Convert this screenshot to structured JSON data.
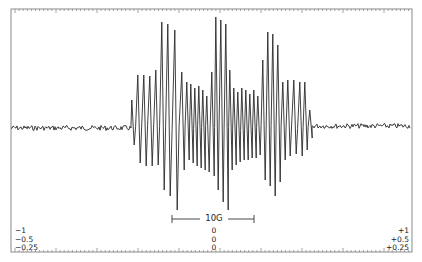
{
  "chart_data": {
    "type": "line",
    "title": "",
    "xlabel": "Magnetic field",
    "ylabel": "First-derivative absorption (dI/dH)",
    "grid": false,
    "legend": null,
    "scale_bar": {
      "label": "10G",
      "x_start_px": 172,
      "x_end_px": 254
    },
    "left_labels": [
      "−1",
      "−0.5",
      "−0.25"
    ],
    "center_labels": [
      "0",
      "0",
      "0"
    ],
    "right_labels": [
      "+1",
      "+0.5",
      "+0.25"
    ],
    "baseline_px": 128,
    "frame_px": {
      "left": 11,
      "top": 9,
      "right": 412,
      "bottom": 252
    },
    "noise_region_left_px": [
      11,
      131
    ],
    "noise_region_right_px": [
      313,
      410
    ],
    "lines": [
      {
        "x": 133,
        "top": 100,
        "bottom": 145
      },
      {
        "x": 139,
        "top": 75,
        "bottom": 163
      },
      {
        "x": 145,
        "top": 75,
        "bottom": 166
      },
      {
        "x": 151,
        "top": 76,
        "bottom": 166
      },
      {
        "x": 157,
        "top": 70,
        "bottom": 165
      },
      {
        "x": 163,
        "top": 22,
        "bottom": 190
      },
      {
        "x": 169,
        "top": 24,
        "bottom": 196
      },
      {
        "x": 176,
        "top": 30,
        "bottom": 210
      },
      {
        "x": 183,
        "top": 72,
        "bottom": 170
      },
      {
        "x": 188,
        "top": 82,
        "bottom": 160
      },
      {
        "x": 192,
        "top": 84,
        "bottom": 163
      },
      {
        "x": 196,
        "top": 88,
        "bottom": 166
      },
      {
        "x": 200,
        "top": 86,
        "bottom": 168
      },
      {
        "x": 204,
        "top": 90,
        "bottom": 170
      },
      {
        "x": 208,
        "top": 96,
        "bottom": 172
      },
      {
        "x": 213,
        "top": 72,
        "bottom": 176
      },
      {
        "x": 217,
        "top": 17,
        "bottom": 190
      },
      {
        "x": 222,
        "top": 20,
        "bottom": 202
      },
      {
        "x": 227,
        "top": 24,
        "bottom": 210
      },
      {
        "x": 231,
        "top": 70,
        "bottom": 170
      },
      {
        "x": 235,
        "top": 88,
        "bottom": 165
      },
      {
        "x": 239,
        "top": 92,
        "bottom": 162
      },
      {
        "x": 243,
        "top": 88,
        "bottom": 160
      },
      {
        "x": 247,
        "top": 90,
        "bottom": 160
      },
      {
        "x": 251,
        "top": 94,
        "bottom": 158
      },
      {
        "x": 255,
        "top": 90,
        "bottom": 158
      },
      {
        "x": 259,
        "top": 96,
        "bottom": 155
      },
      {
        "x": 264,
        "top": 60,
        "bottom": 180
      },
      {
        "x": 269,
        "top": 32,
        "bottom": 186
      },
      {
        "x": 274,
        "top": 34,
        "bottom": 196
      },
      {
        "x": 279,
        "top": 45,
        "bottom": 182
      },
      {
        "x": 284,
        "top": 82,
        "bottom": 160
      },
      {
        "x": 289,
        "top": 80,
        "bottom": 156
      },
      {
        "x": 295,
        "top": 80,
        "bottom": 154
      },
      {
        "x": 301,
        "top": 82,
        "bottom": 156
      },
      {
        "x": 306,
        "top": 82,
        "bottom": 150
      },
      {
        "x": 311,
        "top": 110,
        "bottom": 138
      }
    ]
  },
  "colors": {
    "trace": "#2a2a2a",
    "frame": "#8a8a8a",
    "text": "#222222",
    "background": "#ffffff"
  }
}
